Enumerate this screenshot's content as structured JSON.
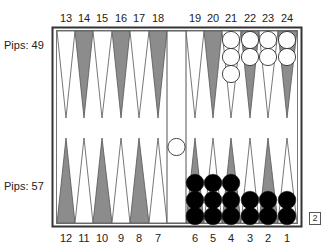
{
  "board": {
    "top_point_numbers": [
      "13",
      "14",
      "15",
      "16",
      "17",
      "18",
      "19",
      "20",
      "21",
      "22",
      "23",
      "24"
    ],
    "bottom_point_numbers": [
      "12",
      "11",
      "10",
      "9",
      "8",
      "7",
      "6",
      "5",
      "4",
      "3",
      "2",
      "1"
    ],
    "pips_top": "Pips: 49",
    "pips_bottom": "Pips: 57",
    "doubling_cube": "2",
    "colors": {
      "dark_point": "#8c8c8c",
      "light_point": "#ffffff",
      "frame": "#333333",
      "white_checker": "#ffffff",
      "black_checker": "#000000"
    },
    "checkers": {
      "white": [
        {
          "point": 21,
          "count": 3
        },
        {
          "point": 22,
          "count": 2
        },
        {
          "point": 23,
          "count": 2
        },
        {
          "point": 24,
          "count": 2
        },
        {
          "point": "bar",
          "count": 1
        }
      ],
      "black": [
        {
          "point": 6,
          "count": 3
        },
        {
          "point": 5,
          "count": 3
        },
        {
          "point": 4,
          "count": 3
        },
        {
          "point": 3,
          "count": 2
        },
        {
          "point": 2,
          "count": 2
        },
        {
          "point": 1,
          "count": 2
        }
      ]
    }
  }
}
